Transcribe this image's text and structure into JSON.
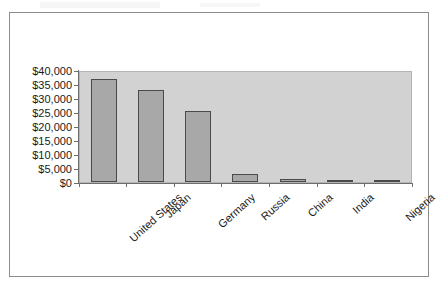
{
  "chart_data": {
    "type": "bar",
    "title": "",
    "subtitle": "",
    "xlabel": "",
    "ylabel": "",
    "categories": [
      "United States",
      "Japan",
      "Germany",
      "Russia",
      "China",
      "India",
      "Nigeria"
    ],
    "values": [
      37500,
      33500,
      25800,
      2800,
      1100,
      900,
      600
    ],
    "series": [
      {
        "name": "",
        "values": [
          37500,
          33500,
          25800,
          2800,
          1100,
          900,
          600
        ]
      }
    ],
    "ylim": [
      0,
      40000
    ],
    "ytick_values": [
      0,
      5000,
      10000,
      15000,
      20000,
      25000,
      30000,
      35000,
      40000
    ],
    "ytick_labels": [
      "$0",
      "$5,000",
      "$10,000",
      "$15,000",
      "$20,000",
      "$25,000",
      "$30,000",
      "$35,000",
      "$40,000"
    ],
    "grid": false,
    "legend": false,
    "legend_position": "none",
    "bar_fill_color": "#a8a8a8",
    "bar_border_color": "#4a4a4a",
    "plot_background_color": "#d2d2d2",
    "axis_color": "#6e6e6e",
    "text_color": "#1a1a1a",
    "figure_background_color": "#ffffff",
    "xtick_label_rotation": -42,
    "annotations": []
  }
}
